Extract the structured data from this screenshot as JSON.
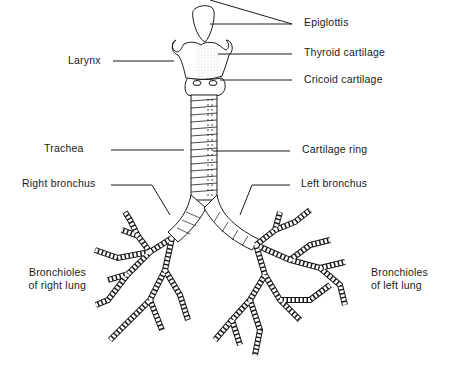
{
  "diagram": {
    "labels": {
      "epiglottis": "Epiglottis",
      "thyroid_cartilage": "Thyroid cartilage",
      "cricoid_cartilage": "Cricoid cartilage",
      "larynx": "Larynx",
      "trachea": "Trachea",
      "cartilage_ring": "Cartilage ring",
      "right_bronchus": "Right bronchus",
      "left_bronchus": "Left bronchus",
      "bronchioles_right_line1": "Bronchioles",
      "bronchioles_right_line2": "of right lung",
      "bronchioles_left_line1": "Bronchioles",
      "bronchioles_left_line2": "of left lung"
    },
    "colors": {
      "ink": "#1a1a1a",
      "background": "#ffffff",
      "stipple": "#bdbdbd"
    }
  }
}
